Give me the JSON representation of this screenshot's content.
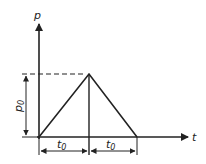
{
  "diagram": {
    "type": "triangular pulse load-time diagram",
    "y_axis_label": "p",
    "x_axis_label": "t",
    "amplitude_label": "p",
    "amplitude_subscript": "0",
    "segments": [
      {
        "label": "t",
        "subscript": "0",
        "description": "rise time"
      },
      {
        "label": "t",
        "subscript": "0",
        "description": "fall time"
      }
    ],
    "colors": {
      "line": "#222222",
      "background": "#ffffff"
    }
  }
}
